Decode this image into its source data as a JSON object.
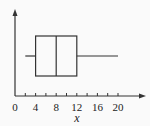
{
  "chart_data": {
    "type": "boxplot",
    "title": "",
    "xlabel": "x",
    "ylabel": "",
    "xlim": [
      0,
      22
    ],
    "x_ticks_minor_step": 2,
    "x_tick_labels": [
      "0",
      "4",
      "8",
      "12",
      "16",
      "20"
    ],
    "box": {
      "min": 2,
      "q1": 4,
      "median": 8,
      "q3": 12,
      "max": 20
    },
    "grid": false,
    "legend": null
  },
  "colors": {
    "stroke": "#333333",
    "background": "#fafafa"
  }
}
